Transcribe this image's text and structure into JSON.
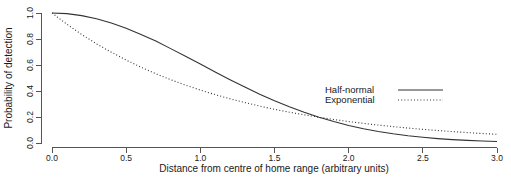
{
  "chart_data": {
    "type": "line",
    "title": "",
    "xlabel": "Distance from centre of home range (arbitrary units)",
    "ylabel": "Probability of detection",
    "xlim": [
      0.0,
      3.0
    ],
    "ylim": [
      0.0,
      1.0
    ],
    "xticks": [
      "0.0",
      "0.5",
      "1.0",
      "1.5",
      "2.0",
      "2.5",
      "3.0"
    ],
    "xtick_values": [
      0.0,
      0.5,
      1.0,
      1.5,
      2.0,
      2.5,
      3.0
    ],
    "yticks": [
      "0.0",
      "0.2",
      "0.4",
      "0.6",
      "0.8",
      "1.0"
    ],
    "ytick_values": [
      0.0,
      0.2,
      0.4,
      0.6,
      0.8,
      1.0
    ],
    "grid": false,
    "legend_position": "right-upper",
    "series": [
      {
        "name": "Half-normal",
        "style": "solid",
        "color": "#333333",
        "x": [
          0.0,
          0.1,
          0.2,
          0.3,
          0.4,
          0.5,
          0.6,
          0.7,
          0.8,
          0.9,
          1.0,
          1.1,
          1.2,
          1.3,
          1.4,
          1.5,
          1.6,
          1.7,
          1.8,
          1.9,
          2.0,
          2.1,
          2.2,
          2.3,
          2.4,
          2.5,
          2.6,
          2.7,
          2.8,
          2.9,
          3.0
        ],
        "values": [
          1.0,
          0.995,
          0.98,
          0.956,
          0.923,
          0.882,
          0.835,
          0.784,
          0.726,
          0.667,
          0.607,
          0.546,
          0.487,
          0.43,
          0.375,
          0.325,
          0.278,
          0.236,
          0.198,
          0.165,
          0.135,
          0.11,
          0.089,
          0.071,
          0.056,
          0.044,
          0.034,
          0.026,
          0.02,
          0.015,
          0.011
        ]
      },
      {
        "name": "Exponential",
        "style": "dotted",
        "color": "#333333",
        "x": [
          0.0,
          0.1,
          0.2,
          0.3,
          0.4,
          0.5,
          0.6,
          0.7,
          0.8,
          0.9,
          1.0,
          1.1,
          1.2,
          1.3,
          1.4,
          1.5,
          1.6,
          1.7,
          1.8,
          1.9,
          2.0,
          2.1,
          2.2,
          2.3,
          2.4,
          2.5,
          2.6,
          2.7,
          2.8,
          2.9,
          3.0
        ],
        "values": [
          1.0,
          0.914,
          0.835,
          0.763,
          0.698,
          0.638,
          0.583,
          0.533,
          0.487,
          0.445,
          0.407,
          0.372,
          0.34,
          0.311,
          0.284,
          0.259,
          0.237,
          0.217,
          0.198,
          0.181,
          0.165,
          0.151,
          0.138,
          0.126,
          0.115,
          0.105,
          0.096,
          0.088,
          0.08,
          0.073,
          0.067
        ]
      }
    ],
    "legend": [
      {
        "label": "Half-normal",
        "style": "solid"
      },
      {
        "label": "Exponential",
        "style": "dotted"
      }
    ]
  }
}
